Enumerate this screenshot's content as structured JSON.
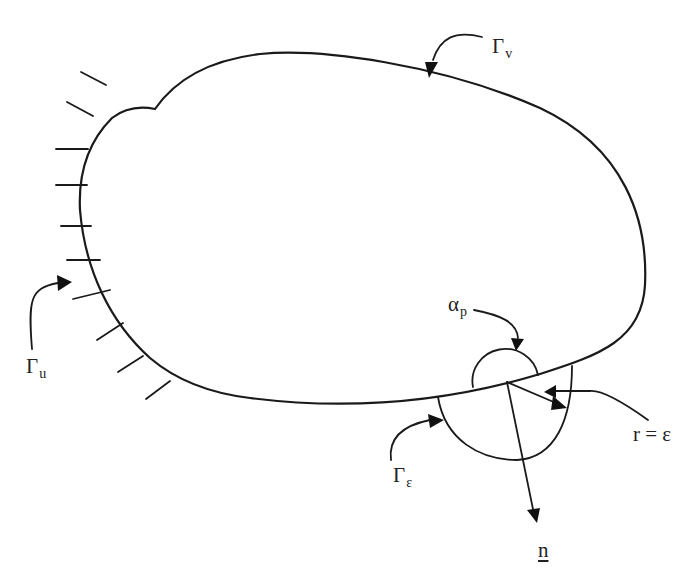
{
  "figure": {
    "type": "boundary-domain-diagram",
    "line_color": "#1a1a1a",
    "background": "#ffffff"
  },
  "labels": {
    "gamma_v": {
      "symbol": "Γ",
      "subscript": "v"
    },
    "gamma_u": {
      "symbol": "Γ",
      "subscript": "u"
    },
    "gamma_eps": {
      "symbol": "Γ",
      "subscript": "ε"
    },
    "alpha_p": {
      "symbol": "α",
      "subscript": "p"
    },
    "radius": {
      "text": "r = ε"
    },
    "normal": {
      "text": "n"
    }
  },
  "hatch_marks": {
    "count": 10,
    "boundary": "Γu (fixed support)"
  }
}
